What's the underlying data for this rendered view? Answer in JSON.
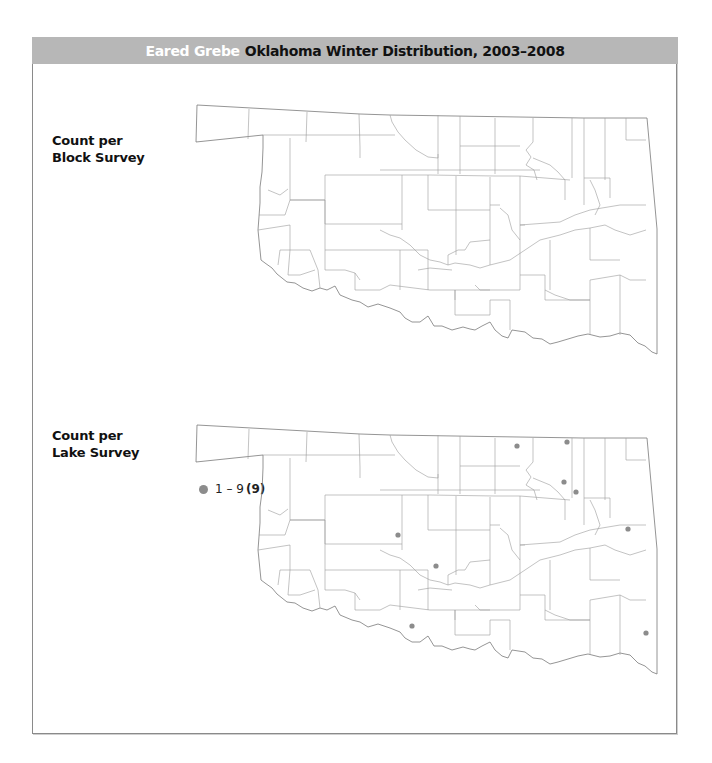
{
  "header": {
    "species": "Eared Grebe",
    "subtitle": "Oklahoma Winter Distribution, 2003–2008",
    "background_color": "#b7b7b7"
  },
  "panels": [
    {
      "label_line1": "Count per",
      "label_line2": "Block Survey",
      "points": []
    },
    {
      "label_line1": "Count per",
      "label_line2": "Lake Survey",
      "legend": {
        "range": "1 – 9",
        "count": "(9)",
        "dot_color": "#8c8c8c"
      },
      "points": [
        {
          "x": 517,
          "y": 446
        },
        {
          "x": 567,
          "y": 442
        },
        {
          "x": 564,
          "y": 482
        },
        {
          "x": 576,
          "y": 492
        },
        {
          "x": 628,
          "y": 529
        },
        {
          "x": 398,
          "y": 535
        },
        {
          "x": 436,
          "y": 566
        },
        {
          "x": 412,
          "y": 626
        },
        {
          "x": 646,
          "y": 633
        }
      ]
    }
  ]
}
